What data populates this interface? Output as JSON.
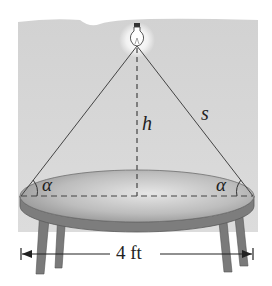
{
  "figure": {
    "type": "geometry-diagram",
    "labels": {
      "height": "h",
      "slant": "s",
      "angle_left": "α",
      "angle_right": "α",
      "diameter": "4 ft"
    },
    "objects": [
      "light-bulb",
      "round-table",
      "light-rays",
      "height-line",
      "diameter-line"
    ]
  },
  "colors": {
    "background": "#d4d4d4",
    "table_top": "#a8a8a8",
    "table_edge": "#6e6e6e",
    "lines": "#444444"
  }
}
